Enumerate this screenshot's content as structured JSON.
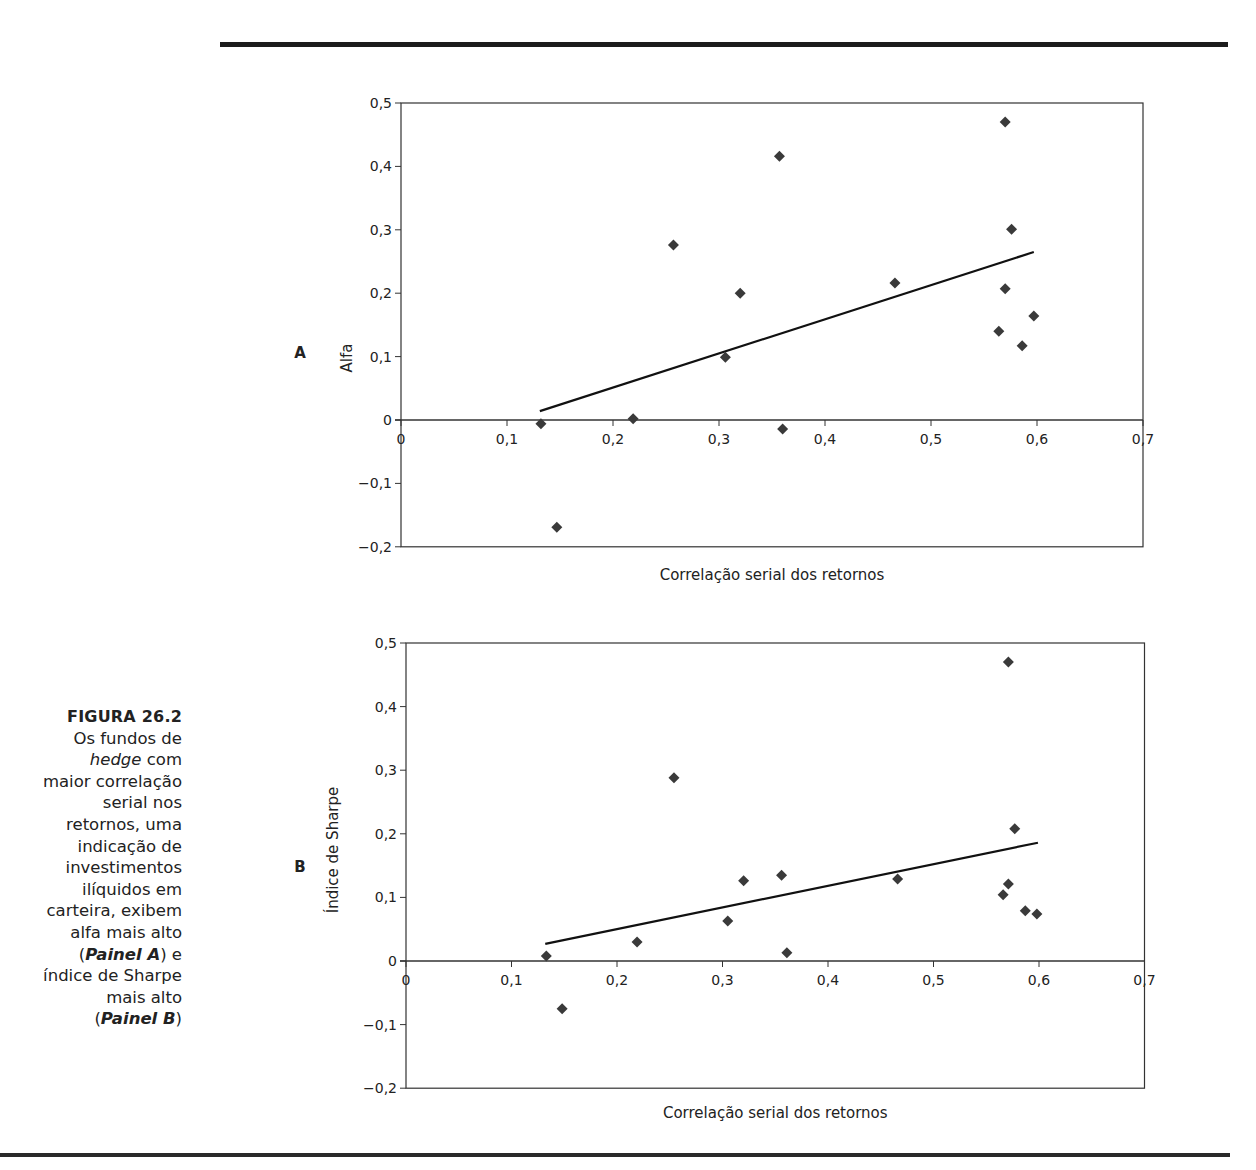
{
  "caption": {
    "figure_label": "FIGURA 26.2",
    "lines": [
      "Os fundos de",
      "hedge com",
      "maior correlação",
      "serial nos",
      "retornos, uma",
      "indicação de",
      "investimentos",
      "ilíquidos em",
      "carteira, exibem",
      "alfa mais alto",
      "(Painel A) e",
      "índice de Sharpe",
      "mais alto",
      "(Painel B)"
    ],
    "italic_word": "hedge",
    "panel_a_ref": "Painel A",
    "panel_b_ref": "Painel B"
  },
  "colors": {
    "marker": "#3a3a3a",
    "line": "#111111",
    "axis": "#333333",
    "rule": "#1c1c1c"
  },
  "chart_data": [
    {
      "type": "scatter",
      "panel": "A",
      "title": "",
      "xlabel": "Correlação serial dos retornos",
      "ylabel": "Alfa",
      "xlim": [
        0,
        0.7
      ],
      "ylim": [
        -0.2,
        0.5
      ],
      "x_ticks": [
        "0",
        "0,1",
        "0,2",
        "0,3",
        "0,4",
        "0,5",
        "0,6",
        "0,7"
      ],
      "y_ticks": [
        "0,5",
        "0,4",
        "0,3",
        "0,2",
        "0,1",
        "0",
        "-0,1",
        "-0,2"
      ],
      "grid": false,
      "legend": null,
      "points": [
        {
          "x": 0.132,
          "y": -0.006
        },
        {
          "x": 0.147,
          "y": -0.169
        },
        {
          "x": 0.219,
          "y": 0.002
        },
        {
          "x": 0.257,
          "y": 0.276
        },
        {
          "x": 0.306,
          "y": 0.099
        },
        {
          "x": 0.32,
          "y": 0.2
        },
        {
          "x": 0.357,
          "y": 0.416
        },
        {
          "x": 0.36,
          "y": -0.014
        },
        {
          "x": 0.466,
          "y": 0.216
        },
        {
          "x": 0.564,
          "y": 0.14
        },
        {
          "x": 0.57,
          "y": 0.47
        },
        {
          "x": 0.57,
          "y": 0.207
        },
        {
          "x": 0.576,
          "y": 0.301
        },
        {
          "x": 0.586,
          "y": 0.117
        },
        {
          "x": 0.597,
          "y": 0.164
        }
      ],
      "trendline": {
        "x1": 0.131,
        "y1": 0.014,
        "x2": 0.597,
        "y2": 0.265
      }
    },
    {
      "type": "scatter",
      "panel": "B",
      "title": "",
      "xlabel": "Correlação serial dos retornos",
      "ylabel": "Índice de Sharpe",
      "xlim": [
        0,
        0.7
      ],
      "ylim": [
        -0.2,
        0.5
      ],
      "x_ticks": [
        "0",
        "0,1",
        "0,2",
        "0,3",
        "0,4",
        "0,5",
        "0,6",
        "0,7"
      ],
      "y_ticks": [
        "0,5",
        "0,4",
        "0,3",
        "0,2",
        "0,1",
        "0",
        "-0,1",
        "-0,2"
      ],
      "grid": false,
      "legend": null,
      "points": [
        {
          "x": 0.133,
          "y": 0.008
        },
        {
          "x": 0.148,
          "y": -0.075
        },
        {
          "x": 0.219,
          "y": 0.03
        },
        {
          "x": 0.254,
          "y": 0.288
        },
        {
          "x": 0.305,
          "y": 0.063
        },
        {
          "x": 0.32,
          "y": 0.126
        },
        {
          "x": 0.356,
          "y": 0.135
        },
        {
          "x": 0.361,
          "y": 0.013
        },
        {
          "x": 0.466,
          "y": 0.129
        },
        {
          "x": 0.566,
          "y": 0.104
        },
        {
          "x": 0.571,
          "y": 0.47
        },
        {
          "x": 0.571,
          "y": 0.121
        },
        {
          "x": 0.577,
          "y": 0.208
        },
        {
          "x": 0.587,
          "y": 0.079
        },
        {
          "x": 0.598,
          "y": 0.074
        }
      ],
      "trendline": {
        "x1": 0.132,
        "y1": 0.027,
        "x2": 0.599,
        "y2": 0.186
      }
    }
  ],
  "layout": {
    "panels": [
      {
        "x0": 401,
        "x_scale": 1060,
        "y0": 420,
        "y_scale": 634,
        "plot_right": 1143,
        "letter_x": 300,
        "letter_y": 358,
        "ylabel_x": 352,
        "ylabel_y": 327,
        "xlabel_y": 580
      },
      {
        "x0": 406,
        "x_scale": 1055,
        "y0": 961,
        "y_scale": 636,
        "plot_right": 1145,
        "letter_x": 300,
        "letter_y": 872,
        "ylabel_x": 338,
        "ylabel_y": 850,
        "xlabel_y": 1118
      }
    ]
  }
}
